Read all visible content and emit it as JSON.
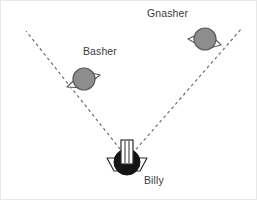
{
  "scene": {
    "width": 257,
    "height": 200,
    "background_color": "#ffffff",
    "border_color": "#e8e8e8",
    "description": "Diagram of robot Billy with a dashed V-shaped field-of-view cone detecting two robots named Basher and Gnasher"
  },
  "robots": [
    {
      "id": "billy",
      "label": "Billy",
      "role": "observer",
      "body_color": "#141414",
      "wing_color": "#ffffff",
      "outline_color": "#2b2b2b",
      "x": 126,
      "y": 161,
      "radius": 13,
      "has_mast": true,
      "label_x": 143,
      "label_y": 173
    },
    {
      "id": "basher",
      "label": "Basher",
      "role": "target",
      "body_color": "#8d8d8d",
      "wing_color": "#ffffff",
      "outline_color": "#5a5a5a",
      "x": 83,
      "y": 78,
      "radius": 11,
      "has_mast": false,
      "label_x": 82,
      "label_y": 44
    },
    {
      "id": "gnasher",
      "label": "Gnasher",
      "role": "target",
      "body_color": "#8d8d8d",
      "wing_color": "#ffffff",
      "outline_color": "#5a5a5a",
      "x": 204,
      "y": 38,
      "radius": 11,
      "has_mast": false,
      "label_x": 146,
      "label_y": 6
    }
  ],
  "sight_lines": [
    {
      "id": "left-sight-line",
      "from_x": 123,
      "from_y": 153,
      "to_x": 25,
      "to_y": 30,
      "style": "dashed",
      "color": "#6e6e6e",
      "width": 1.2,
      "dash": "3 3"
    },
    {
      "id": "right-sight-line",
      "from_x": 131,
      "from_y": 153,
      "to_x": 241,
      "to_y": 27,
      "style": "dashed",
      "color": "#6e6e6e",
      "width": 1.2,
      "dash": "3 3"
    }
  ],
  "colors": {
    "target_fill": "#8d8d8d",
    "observer_fill": "#141414",
    "line": "#6e6e6e",
    "text": "#3a3a3a"
  }
}
